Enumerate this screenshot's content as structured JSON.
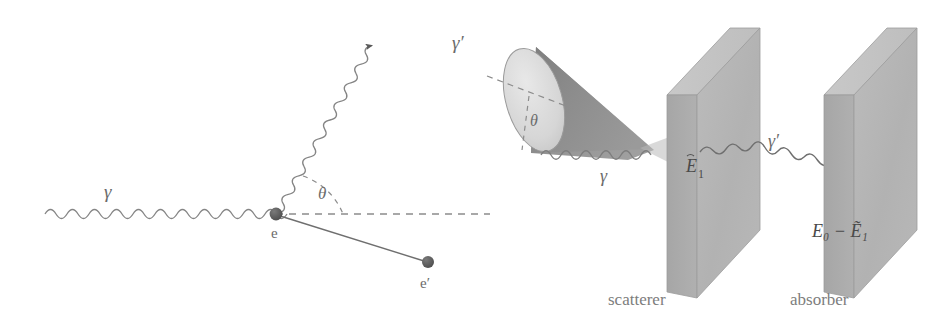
{
  "figure": {
    "background_color": "#ffffff",
    "line_color": "#7a7a7a",
    "dark_line_color": "#555555",
    "slab_face_color": "#b4b4b4",
    "slab_side_color": "#a0a0a0",
    "slab_top_color": "#c6c6c6",
    "cone_body_color": "#8e8e8e",
    "cone_cap_color": "#dcdcdc"
  },
  "left_panel": {
    "name": "compton-scattering-vertex",
    "labels": {
      "incoming_photon": "γ",
      "scattered_photon": "γ′",
      "electron": "e",
      "recoil_electron": "e′",
      "scattering_angle": "θ"
    },
    "elements": {
      "incoming_photon_line": "wavy-horizontal-line",
      "scattered_photon_line": "wavy-diagonal-line-with-arrow",
      "recoil_electron_line": "straight-line-to-dot",
      "reference_axis": "dashed-horizontal-line",
      "angle_arc": "dashed-arc",
      "vertex_dot": "filled-circle",
      "recoil_dot": "filled-circle"
    }
  },
  "right_panel": {
    "name": "scatterer-absorber-setup",
    "labels": {
      "cone_angle": "θ",
      "incoming_photon": "γ",
      "scattered_photon": "γ′",
      "scatterer_energy": "Ẽ₁",
      "scatterer_energy_base": "E",
      "scatterer_energy_sub": "1",
      "absorber_energy": "E₀ − Ẽ₁",
      "scatterer_caption": "scatterer",
      "absorber_caption": "absorber"
    },
    "elements": {
      "cone": "shaded-cone",
      "cone_cap": "ellipse-cap",
      "cone_axis": "dashed-axis-line",
      "cone_radius": "dashed-radius-line",
      "scatterer_slab": "3d-slab",
      "absorber_slab": "3d-slab",
      "incoming_photon_line": "wavy-line",
      "scattered_photon_line": "wavy-line"
    }
  }
}
